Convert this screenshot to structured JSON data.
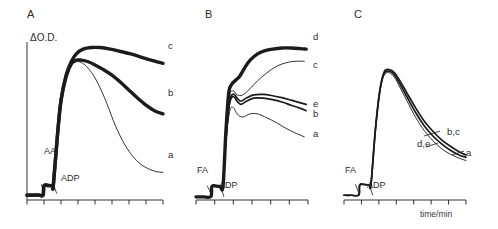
{
  "figure": {
    "axis_y_label": "ΔO.D.",
    "axis_x_label": "time/min",
    "panels": [
      {
        "letter": "A",
        "additions": [
          {
            "name": "AA",
            "label": "AA"
          },
          {
            "name": "ADP",
            "label": "ADP"
          }
        ],
        "curve_labels": [
          {
            "name": "curve-c",
            "label": "c"
          },
          {
            "name": "curve-b",
            "label": "b"
          },
          {
            "name": "curve-a",
            "label": "a"
          }
        ]
      },
      {
        "letter": "B",
        "additions": [
          {
            "name": "FA",
            "label": "FA"
          },
          {
            "name": "ADP",
            "label": "ADP"
          }
        ],
        "curve_labels": [
          {
            "name": "curve-d",
            "label": "d"
          },
          {
            "name": "curve-c",
            "label": "c"
          },
          {
            "name": "curve-e",
            "label": "e"
          },
          {
            "name": "curve-b",
            "label": "b"
          },
          {
            "name": "curve-a",
            "label": "a"
          }
        ]
      },
      {
        "letter": "C",
        "additions": [
          {
            "name": "FA",
            "label": "FA"
          },
          {
            "name": "ADP",
            "label": "ADP"
          }
        ],
        "curve_labels": [
          {
            "name": "curve-bc",
            "label": "b,c"
          },
          {
            "name": "curve-de",
            "label": "d,e"
          },
          {
            "name": "curve-a",
            "label": "a"
          }
        ]
      }
    ]
  },
  "chart_data": [
    {
      "type": "line",
      "panel": "A",
      "title": "A",
      "xlabel": "time/min",
      "ylabel": "ΔO.D.",
      "grid": false,
      "legend": "right-inline",
      "xlim": [
        0,
        8
      ],
      "ylim": [
        0,
        1
      ],
      "x_ticks": [
        0,
        1,
        2,
        3,
        4,
        5,
        6,
        7,
        8
      ],
      "annotations": [
        {
          "text": "AA",
          "x": 0.85,
          "y": 0.1,
          "arrow_to_x": 1.0,
          "arrow_to_y": 0.03
        },
        {
          "text": "ADP",
          "x": 1.75,
          "y": 0.04,
          "arrow_to_x": 1.55,
          "arrow_to_y": 0.1
        }
      ],
      "series": [
        {
          "name": "a",
          "style": "thin",
          "x": [
            0.0,
            0.25,
            0.5,
            0.75,
            0.95,
            1.0,
            1.25,
            1.5,
            1.55,
            1.8,
            2.0,
            2.3,
            2.6,
            2.9,
            3.2,
            3.5,
            3.9,
            4.3,
            4.7,
            5.2,
            5.7,
            6.2,
            6.7,
            7.2,
            7.6,
            8.0
          ],
          "y": [
            0.03,
            0.03,
            0.032,
            0.03,
            0.032,
            0.09,
            0.092,
            0.09,
            0.095,
            0.42,
            0.63,
            0.78,
            0.855,
            0.875,
            0.87,
            0.845,
            0.79,
            0.71,
            0.61,
            0.47,
            0.36,
            0.28,
            0.225,
            0.195,
            0.18,
            0.175
          ]
        },
        {
          "name": "b",
          "style": "thick",
          "x": [
            0.0,
            0.25,
            0.5,
            0.75,
            0.95,
            1.0,
            1.25,
            1.5,
            1.55,
            1.8,
            2.0,
            2.3,
            2.6,
            2.9,
            3.2,
            3.6,
            4.0,
            4.5,
            5.0,
            5.5,
            6.0,
            6.5,
            7.0,
            7.5,
            8.0
          ],
          "y": [
            0.03,
            0.03,
            0.032,
            0.03,
            0.032,
            0.09,
            0.092,
            0.09,
            0.095,
            0.42,
            0.63,
            0.78,
            0.86,
            0.885,
            0.885,
            0.875,
            0.855,
            0.825,
            0.79,
            0.745,
            0.695,
            0.645,
            0.6,
            0.565,
            0.545
          ]
        },
        {
          "name": "c",
          "style": "thick",
          "x": [
            0.0,
            0.25,
            0.5,
            0.75,
            0.95,
            1.0,
            1.25,
            1.5,
            1.55,
            1.8,
            2.0,
            2.3,
            2.6,
            2.9,
            3.3,
            3.8,
            4.3,
            4.9,
            5.5,
            6.1,
            6.7,
            7.3,
            8.0
          ],
          "y": [
            0.03,
            0.03,
            0.032,
            0.03,
            0.032,
            0.09,
            0.092,
            0.09,
            0.095,
            0.42,
            0.63,
            0.79,
            0.875,
            0.925,
            0.955,
            0.965,
            0.965,
            0.955,
            0.94,
            0.925,
            0.905,
            0.885,
            0.865
          ]
        }
      ]
    },
    {
      "type": "line",
      "panel": "B",
      "title": "B",
      "xlabel": "time/min",
      "ylabel": "ΔO.D.",
      "grid": false,
      "legend": "right-inline",
      "xlim": [
        0,
        6
      ],
      "ylim": [
        0,
        1
      ],
      "x_ticks": [
        0,
        1,
        2,
        3,
        4,
        5,
        6
      ],
      "annotations": [
        {
          "text": "FA",
          "x": 0.6,
          "y": 0.09,
          "arrow_to_x": 0.85,
          "arrow_to_y": 0.03
        },
        {
          "text": "ADP",
          "x": 1.5,
          "y": 0.02,
          "arrow_to_x": 1.3,
          "arrow_to_y": 0.09
        }
      ],
      "series": [
        {
          "name": "a",
          "style": "thin",
          "x": [
            0.0,
            0.4,
            0.8,
            0.85,
            1.1,
            1.3,
            1.45,
            1.6,
            1.8,
            2.0,
            2.2,
            2.5,
            2.9,
            3.3,
            3.8,
            4.3,
            4.8,
            5.3,
            5.8
          ],
          "y": [
            0.02,
            0.02,
            0.022,
            0.085,
            0.088,
            0.085,
            0.09,
            0.36,
            0.56,
            0.585,
            0.545,
            0.525,
            0.545,
            0.545,
            0.52,
            0.49,
            0.455,
            0.425,
            0.4
          ]
        },
        {
          "name": "b",
          "style": "medium",
          "x": [
            0.0,
            0.4,
            0.8,
            0.85,
            1.1,
            1.3,
            1.45,
            1.6,
            1.8,
            2.0,
            2.2,
            2.4,
            2.7,
            3.1,
            3.6,
            4.1,
            4.6,
            5.1,
            5.6,
            5.9
          ],
          "y": [
            0.02,
            0.02,
            0.022,
            0.085,
            0.088,
            0.085,
            0.09,
            0.38,
            0.61,
            0.655,
            0.625,
            0.605,
            0.625,
            0.645,
            0.645,
            0.635,
            0.62,
            0.6,
            0.58,
            0.565
          ]
        },
        {
          "name": "e",
          "style": "medium",
          "x": [
            0.0,
            0.4,
            0.8,
            0.85,
            1.1,
            1.3,
            1.45,
            1.6,
            1.8,
            2.0,
            2.2,
            2.4,
            2.7,
            3.1,
            3.6,
            4.1,
            4.6,
            5.1,
            5.6,
            5.9
          ],
          "y": [
            0.02,
            0.02,
            0.022,
            0.085,
            0.088,
            0.085,
            0.09,
            0.39,
            0.625,
            0.67,
            0.645,
            0.625,
            0.645,
            0.665,
            0.668,
            0.66,
            0.648,
            0.632,
            0.615,
            0.605
          ]
        },
        {
          "name": "c",
          "style": "thin",
          "x": [
            0.0,
            0.4,
            0.8,
            0.85,
            1.1,
            1.3,
            1.45,
            1.6,
            1.8,
            2.0,
            2.2,
            2.5,
            2.9,
            3.3,
            3.8,
            4.3,
            4.8,
            5.3,
            5.8
          ],
          "y": [
            0.02,
            0.02,
            0.022,
            0.085,
            0.088,
            0.085,
            0.09,
            0.4,
            0.655,
            0.69,
            0.665,
            0.665,
            0.705,
            0.755,
            0.805,
            0.845,
            0.868,
            0.878,
            0.878
          ]
        },
        {
          "name": "d",
          "style": "thick",
          "x": [
            0.0,
            0.4,
            0.8,
            0.85,
            1.1,
            1.3,
            1.45,
            1.6,
            1.75,
            1.9,
            2.1,
            2.35,
            2.6,
            2.9,
            3.3,
            3.7,
            4.1,
            4.6,
            5.1,
            5.6,
            5.9
          ],
          "y": [
            0.02,
            0.02,
            0.022,
            0.085,
            0.088,
            0.085,
            0.09,
            0.43,
            0.675,
            0.73,
            0.755,
            0.785,
            0.835,
            0.885,
            0.925,
            0.945,
            0.955,
            0.962,
            0.962,
            0.958,
            0.955
          ]
        }
      ]
    },
    {
      "type": "line",
      "panel": "C",
      "title": "C",
      "xlabel": "time/min",
      "ylabel": "ΔO.D.",
      "grid": false,
      "legend": "right-inline",
      "xlim": [
        0,
        7
      ],
      "ylim": [
        0,
        1
      ],
      "x_ticks": [
        0,
        1,
        2,
        3,
        4,
        5,
        6,
        7
      ],
      "annotations": [
        {
          "text": "FA",
          "x": 0.65,
          "y": 0.1,
          "arrow_to_x": 0.9,
          "arrow_to_y": 0.03
        },
        {
          "text": "ADP",
          "x": 1.65,
          "y": 0.03,
          "arrow_to_x": 1.45,
          "arrow_to_y": 0.1
        }
      ],
      "series": [
        {
          "name": "a",
          "style": "thin",
          "x": [
            0.0,
            0.4,
            0.85,
            0.9,
            1.2,
            1.45,
            1.55,
            1.8,
            2.05,
            2.3,
            2.6,
            2.9,
            3.2,
            3.6,
            4.1,
            4.6,
            5.1,
            5.6,
            6.1,
            6.6,
            7.0
          ],
          "y": [
            0.03,
            0.03,
            0.032,
            0.095,
            0.098,
            0.095,
            0.1,
            0.44,
            0.68,
            0.79,
            0.805,
            0.775,
            0.715,
            0.63,
            0.525,
            0.44,
            0.375,
            0.325,
            0.29,
            0.265,
            0.25
          ]
        },
        {
          "name": "d,e",
          "style": "medium",
          "x": [
            0.0,
            0.4,
            0.85,
            0.9,
            1.2,
            1.45,
            1.55,
            1.8,
            2.05,
            2.3,
            2.6,
            2.9,
            3.2,
            3.6,
            4.1,
            4.6,
            5.1,
            5.6,
            6.1,
            6.6,
            7.0
          ],
          "y": [
            0.03,
            0.03,
            0.032,
            0.095,
            0.098,
            0.095,
            0.1,
            0.44,
            0.685,
            0.8,
            0.815,
            0.79,
            0.735,
            0.655,
            0.555,
            0.47,
            0.405,
            0.355,
            0.315,
            0.285,
            0.27
          ]
        },
        {
          "name": "b,c",
          "style": "medium",
          "x": [
            0.0,
            0.4,
            0.85,
            0.9,
            1.2,
            1.45,
            1.55,
            1.8,
            2.05,
            2.3,
            2.6,
            2.9,
            3.2,
            3.6,
            4.1,
            4.6,
            5.1,
            5.6,
            6.1,
            6.6,
            7.0
          ],
          "y": [
            0.03,
            0.03,
            0.032,
            0.095,
            0.098,
            0.095,
            0.1,
            0.445,
            0.69,
            0.81,
            0.825,
            0.805,
            0.755,
            0.68,
            0.585,
            0.5,
            0.435,
            0.38,
            0.34,
            0.305,
            0.285
          ]
        }
      ]
    }
  ]
}
